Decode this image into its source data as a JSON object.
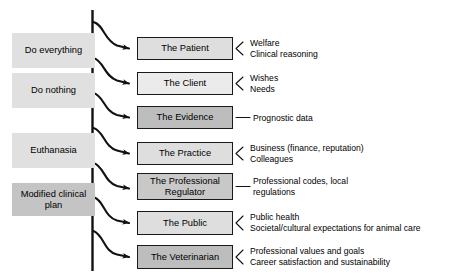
{
  "figure": {
    "type": "flow-diagram",
    "background": "#ffffff",
    "trunk_line_label": "decision-trunk"
  },
  "colors": {
    "light_gray": "#e0e0e0",
    "mid_gray": "#c9c9c9",
    "dark_gray": "#b0b0b0",
    "stroke": "#1a1a1a",
    "text": "#000000"
  },
  "options": [
    {
      "label": "Do everything",
      "shade": "light",
      "x": 12,
      "y": 33,
      "w": 83,
      "h": 35
    },
    {
      "label": "Do nothing",
      "shade": "light",
      "x": 12,
      "y": 73,
      "w": 83,
      "h": 35
    },
    {
      "label": "Euthanasia",
      "shade": "light",
      "x": 12,
      "y": 133,
      "w": 83,
      "h": 35
    },
    {
      "label": "Modified clinical\nplan",
      "shade": "dark",
      "x": 12,
      "y": 183,
      "w": 83,
      "h": 33
    }
  ],
  "nodes": [
    {
      "label": "The Patient",
      "shade": "light",
      "x": 137,
      "y": 37,
      "w": 96,
      "h": 23,
      "connector": "fork",
      "annotations": [
        "Welfare",
        "Clinical reasoning"
      ]
    },
    {
      "label": "The Client",
      "shade": "light",
      "x": 137,
      "y": 72,
      "w": 96,
      "h": 23,
      "connector": "fork",
      "annotations": [
        "Wishes",
        "Needs"
      ]
    },
    {
      "label": "The Evidence",
      "shade": "dark",
      "x": 137,
      "y": 106,
      "w": 96,
      "h": 23,
      "connector": "line",
      "annotations": [
        "Prognostic data"
      ]
    },
    {
      "label": "The Practice",
      "shade": "light",
      "x": 137,
      "y": 142,
      "w": 96,
      "h": 23,
      "connector": "fork",
      "annotations": [
        "Business (finance, reputation)",
        "Colleagues"
      ]
    },
    {
      "label": "The Professional\nRegulator",
      "shade": "dark",
      "x": 137,
      "y": 173,
      "w": 96,
      "h": 27,
      "connector": "line",
      "annotations": [
        "Professional codes, local",
        "regulations"
      ]
    },
    {
      "label": "The Public",
      "shade": "light",
      "x": 137,
      "y": 211,
      "w": 96,
      "h": 24,
      "connector": "fork",
      "annotations": [
        "Public health",
        "Societal/cultural expectations for animal care"
      ]
    },
    {
      "label": "The Veterinarian",
      "shade": "dark",
      "x": 137,
      "y": 245,
      "w": 96,
      "h": 24,
      "connector": "fork",
      "annotations": [
        "Professional values and goals",
        "Career satisfaction and sustainability"
      ]
    }
  ]
}
